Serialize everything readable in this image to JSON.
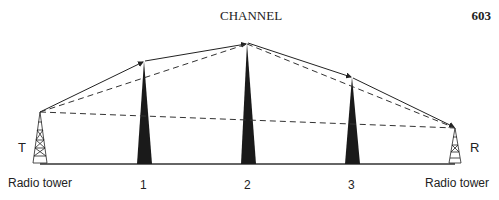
{
  "header": {
    "title": "CHANNEL",
    "page_number": "603"
  },
  "diagram": {
    "transmitter": {
      "letter": "T",
      "label": "Radio tower"
    },
    "receiver": {
      "letter": "R",
      "label": "Radio tower"
    },
    "relays": [
      {
        "label": "1"
      },
      {
        "label": "2"
      },
      {
        "label": "3"
      }
    ]
  }
}
